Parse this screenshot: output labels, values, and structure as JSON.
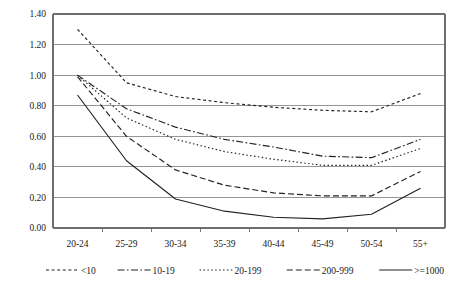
{
  "chart_data": {
    "type": "line",
    "title": "",
    "subtitle": "",
    "xlabel": "",
    "ylabel": "",
    "categories": [
      "20-24",
      "25-29",
      "30-34",
      "35-39",
      "40-44",
      "45-49",
      "50-54",
      "55+"
    ],
    "ylim": [
      0.0,
      1.4
    ],
    "ytick_labels": [
      "0.00",
      "0.20",
      "0.40",
      "0.60",
      "0.80",
      "1.00",
      "1.20",
      "1.40"
    ],
    "ytick_values": [
      0.0,
      0.2,
      0.4,
      0.6,
      0.8,
      1.0,
      1.2,
      1.4
    ],
    "grid": true,
    "legend_position": "bottom",
    "series": [
      {
        "name": "<10",
        "dash": "3,2.6",
        "values": [
          1.3,
          0.95,
          0.86,
          0.82,
          0.79,
          0.77,
          0.76,
          0.88
        ]
      },
      {
        "name": "10-19",
        "dash": "7,2.4,1.6,2.4",
        "values": [
          1.0,
          0.78,
          0.66,
          0.58,
          0.53,
          0.47,
          0.46,
          0.58
        ]
      },
      {
        "name": "20-199",
        "dash": "1.5,2.4",
        "values": [
          1.0,
          0.72,
          0.58,
          0.5,
          0.45,
          0.41,
          0.41,
          0.52
        ]
      },
      {
        "name": "200-999",
        "dash": "6,3",
        "values": [
          0.99,
          0.6,
          0.38,
          0.28,
          0.23,
          0.21,
          0.21,
          0.37
        ]
      },
      {
        "name": ">=1000",
        "dash": "none",
        "values": [
          0.87,
          0.44,
          0.19,
          0.11,
          0.07,
          0.06,
          0.09,
          0.26
        ]
      }
    ]
  },
  "legend": {
    "items": [
      {
        "label": "<10"
      },
      {
        "label": "10-19"
      },
      {
        "label": "20-199"
      },
      {
        "label": "200-999"
      },
      {
        "label": ">=1000"
      }
    ]
  },
  "colors": {
    "series_stroke": "#222222",
    "gridline": "#8a8a8a",
    "axis": "#6e6e6e",
    "background": "#ffffff",
    "text": "#1a1a1a"
  }
}
